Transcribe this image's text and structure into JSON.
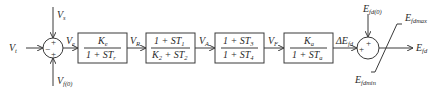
{
  "diagram": {
    "type": "block-diagram",
    "colors": {
      "line": "#3a3a3a",
      "text": "#2a2a2a",
      "background": "#ffffff"
    },
    "summer1": {
      "inputs": [
        {
          "name": "V",
          "sub": "t",
          "sign": "−",
          "from": "left"
        },
        {
          "name": "V",
          "sub": "s",
          "sign": "+",
          "from": "top"
        },
        {
          "name": "V",
          "sub": "f(0)",
          "sign": "+",
          "from": "bottom"
        }
      ],
      "output": {
        "name": "V",
        "sub": "e"
      }
    },
    "blocks": [
      {
        "num": "K",
        "num_sub": "e",
        "den_pre": "1 + ST",
        "den_sub": "r",
        "output": {
          "name": "V",
          "sub": "R"
        }
      },
      {
        "num_pre": "1 + ST",
        "num_sub": "1",
        "den_pre": "K",
        "den_sub": "2",
        "den_mid": " + ST",
        "den_sub2": "2",
        "output": {
          "name": "V",
          "sub": "A"
        }
      },
      {
        "num_pre": "1 + ST",
        "num_sub": "3",
        "den_pre": "1 + ST",
        "den_sub": "4",
        "output": {
          "name": "V",
          "sub": "F"
        }
      },
      {
        "num": "K",
        "num_sub": "a",
        "den_pre": "1 + ST",
        "den_sub": "a",
        "output": {
          "name": "ΔE",
          "sub": "fd"
        }
      }
    ],
    "summer2": {
      "inputs": [
        {
          "name": "E",
          "sub": "fd(0)",
          "sign": "+",
          "from": "top"
        },
        {
          "sign": "+",
          "from": "left"
        }
      ]
    },
    "limiter": {
      "max": {
        "name": "E",
        "sub": "fdmax"
      },
      "min": {
        "name": "E",
        "sub": "fdmin"
      }
    },
    "final_output": {
      "name": "E",
      "sub": "fd"
    }
  }
}
